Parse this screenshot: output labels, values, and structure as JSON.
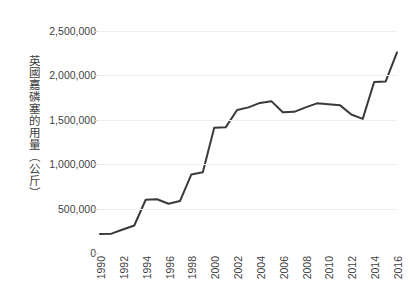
{
  "chart_data": {
    "type": "line",
    "title": "",
    "subtitle": "",
    "xlabel": "",
    "ylabel": "英國嘉磷塞的用量（公斤）",
    "ylim": [
      0,
      2500000
    ],
    "xlim": [
      1990,
      2016
    ],
    "grid": true,
    "legend": false,
    "legend_position": "none",
    "line_color": "#3a3a3a",
    "gridline_color": "#efefef",
    "text_color": "#3f3f3f",
    "y_ticks": [
      0,
      500000,
      1000000,
      1500000,
      2000000,
      2500000
    ],
    "y_tick_labels": [
      "0",
      "500,000",
      "1,000,000",
      "1,500,000",
      "2,000,000",
      "2,500,000"
    ],
    "x_ticks": [
      1990,
      1992,
      1994,
      1996,
      1998,
      2000,
      2002,
      2004,
      2006,
      2008,
      2010,
      2012,
      2014,
      2016
    ],
    "x_tick_labels": [
      "1990",
      "1992",
      "1994",
      "1996",
      "1998",
      "2000",
      "2002",
      "2004",
      "2006",
      "2008",
      "2010",
      "2012",
      "2014",
      "2016"
    ],
    "x": [
      1990,
      1991,
      1992,
      1993,
      1994,
      1995,
      1996,
      1997,
      1998,
      1999,
      2000,
      2001,
      2002,
      2003,
      2004,
      2005,
      2006,
      2007,
      2008,
      2009,
      2010,
      2011,
      2012,
      2013,
      2014,
      2015,
      2016
    ],
    "values": [
      215000,
      218000,
      265000,
      310000,
      600000,
      605000,
      555000,
      585000,
      885000,
      910000,
      1410000,
      1415000,
      1610000,
      1640000,
      1690000,
      1710000,
      1585000,
      1590000,
      1640000,
      1685000,
      1675000,
      1665000,
      1560000,
      1510000,
      1925000,
      1930000,
      2260000
    ],
    "series": [
      {
        "name": "英國嘉磷塞的用量",
        "values": [
          215000,
          218000,
          265000,
          310000,
          600000,
          605000,
          555000,
          585000,
          885000,
          910000,
          1410000,
          1415000,
          1610000,
          1640000,
          1690000,
          1710000,
          1585000,
          1590000,
          1640000,
          1685000,
          1675000,
          1665000,
          1560000,
          1510000,
          1925000,
          1930000,
          2260000
        ]
      }
    ]
  }
}
